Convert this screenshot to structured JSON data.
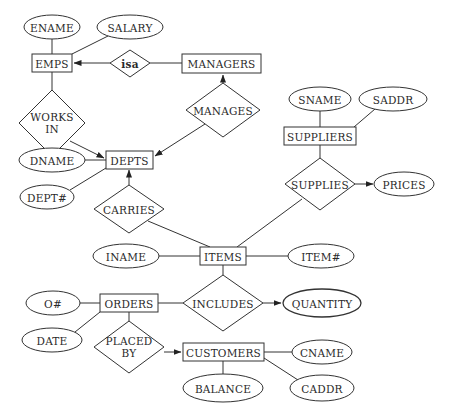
{
  "diagram": {
    "type": "entity-relationship",
    "entities": [
      {
        "id": "emps",
        "label": "EMPS"
      },
      {
        "id": "managers",
        "label": "MANAGERS"
      },
      {
        "id": "depts",
        "label": "DEPTS"
      },
      {
        "id": "suppliers",
        "label": "SUPPLIERS"
      },
      {
        "id": "items",
        "label": "ITEMS"
      },
      {
        "id": "orders",
        "label": "ORDERS"
      },
      {
        "id": "customers",
        "label": "CUSTOMERS"
      }
    ],
    "relationships": [
      {
        "id": "isa",
        "label": "isa"
      },
      {
        "id": "works_in",
        "label_line1": "WORKS",
        "label_line2": "IN"
      },
      {
        "id": "manages",
        "label": "MANAGES"
      },
      {
        "id": "carries",
        "label": "CARRIES"
      },
      {
        "id": "supplies",
        "label": "SUPPLIES"
      },
      {
        "id": "includes",
        "label": "INCLUDES"
      },
      {
        "id": "placed_by",
        "label_line1": "PLACED",
        "label_line2": "BY"
      }
    ],
    "attributes": [
      {
        "id": "ename",
        "label": "ENAME",
        "of": "EMPS"
      },
      {
        "id": "salary",
        "label": "SALARY",
        "of": "EMPS"
      },
      {
        "id": "dname",
        "label": "DNAME",
        "of": "DEPTS"
      },
      {
        "id": "dept_no",
        "label": "DEPT#",
        "of": "DEPTS"
      },
      {
        "id": "sname",
        "label": "SNAME",
        "of": "SUPPLIERS"
      },
      {
        "id": "saddr",
        "label": "SADDR",
        "of": "SUPPLIERS"
      },
      {
        "id": "prices",
        "label": "PRICES",
        "of": "SUPPLIES"
      },
      {
        "id": "iname",
        "label": "INAME",
        "of": "ITEMS"
      },
      {
        "id": "item_no",
        "label": "ITEM#",
        "of": "ITEMS"
      },
      {
        "id": "order_no",
        "label": "O#",
        "of": "ORDERS"
      },
      {
        "id": "date",
        "label": "DATE",
        "of": "ORDERS"
      },
      {
        "id": "quantity",
        "label": "QUANTITY",
        "of": "INCLUDES"
      },
      {
        "id": "cname",
        "label": "CNAME",
        "of": "CUSTOMERS"
      },
      {
        "id": "caddr",
        "label": "CADDR",
        "of": "CUSTOMERS"
      },
      {
        "id": "balance",
        "label": "BALANCE",
        "of": "CUSTOMERS"
      }
    ],
    "edges": [
      {
        "from": "ENAME",
        "to": "EMPS",
        "arrow": false
      },
      {
        "from": "SALARY",
        "to": "EMPS",
        "arrow": false
      },
      {
        "from": "isa",
        "to": "EMPS",
        "arrow": true
      },
      {
        "from": "MANAGERS",
        "to": "isa",
        "arrow": false
      },
      {
        "from": "EMPS",
        "to": "WORKS IN",
        "arrow": false
      },
      {
        "from": "WORKS IN",
        "to": "DEPTS",
        "arrow": true
      },
      {
        "from": "MANAGES",
        "to": "MANAGERS",
        "arrow": true
      },
      {
        "from": "MANAGES",
        "to": "DEPTS",
        "arrow": true
      },
      {
        "from": "DNAME",
        "to": "DEPTS",
        "arrow": false
      },
      {
        "from": "DEPT#",
        "to": "DEPTS",
        "arrow": false
      },
      {
        "from": "CARRIES",
        "to": "DEPTS",
        "arrow": true
      },
      {
        "from": "CARRIES",
        "to": "ITEMS",
        "arrow": false
      },
      {
        "from": "SNAME",
        "to": "SUPPLIERS",
        "arrow": false
      },
      {
        "from": "SADDR",
        "to": "SUPPLIERS",
        "arrow": false
      },
      {
        "from": "SUPPLIERS",
        "to": "SUPPLIES",
        "arrow": false
      },
      {
        "from": "SUPPLIES",
        "to": "PRICES",
        "arrow": true
      },
      {
        "from": "SUPPLIES",
        "to": "ITEMS",
        "arrow": false
      },
      {
        "from": "INAME",
        "to": "ITEMS",
        "arrow": false
      },
      {
        "from": "ITEMS",
        "to": "ITEM#",
        "arrow": false
      },
      {
        "from": "ITEMS",
        "to": "INCLUDES",
        "arrow": false
      },
      {
        "from": "ORDERS",
        "to": "INCLUDES",
        "arrow": false
      },
      {
        "from": "INCLUDES",
        "to": "QUANTITY",
        "arrow": true
      },
      {
        "from": "O#",
        "to": "ORDERS",
        "arrow": false
      },
      {
        "from": "DATE",
        "to": "ORDERS",
        "arrow": false
      },
      {
        "from": "ORDERS",
        "to": "PLACED BY",
        "arrow": false
      },
      {
        "from": "PLACED BY",
        "to": "CUSTOMERS",
        "arrow": true
      },
      {
        "from": "CUSTOMERS",
        "to": "CNAME",
        "arrow": false
      },
      {
        "from": "CUSTOMERS",
        "to": "CADDR",
        "arrow": false
      },
      {
        "from": "CUSTOMERS",
        "to": "BALANCE",
        "arrow": false
      }
    ]
  },
  "colors": {
    "stroke": "#333333",
    "text": "#2a2a2a",
    "background": "#ffffff"
  }
}
